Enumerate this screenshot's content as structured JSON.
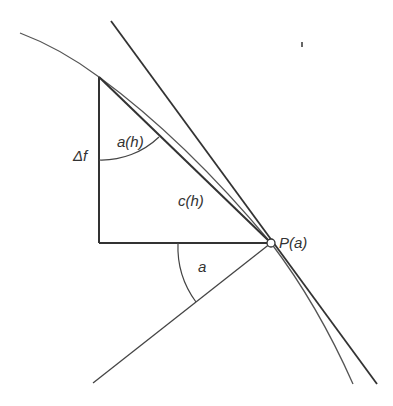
{
  "diagram": {
    "title": "",
    "labels": {
      "delta_f": "Δf",
      "angle_h": "a(h)",
      "chord": "c(h)",
      "point": "P(a)",
      "angle_a": "a"
    },
    "colors": {
      "stroke": "#333333",
      "curve": "#555555",
      "background": "#ffffff"
    },
    "elements": [
      "curve",
      "tangent-line",
      "chord-line",
      "vertical-leg",
      "horizontal-leg",
      "lower-line",
      "angle-arc-h",
      "angle-arc-a",
      "point-marker"
    ]
  }
}
